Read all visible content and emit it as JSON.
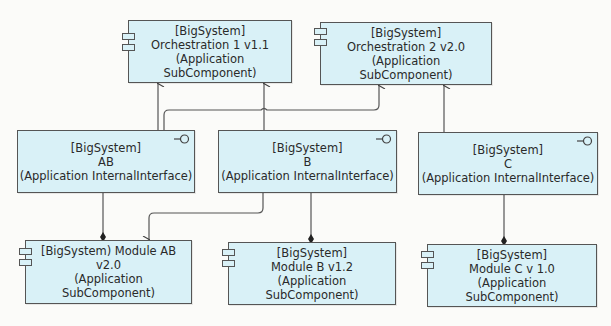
{
  "colors": {
    "node_fill": "#d9f1f7",
    "line": "#555555",
    "background": "#fbfbf9"
  },
  "nodes": {
    "orch1": {
      "label": "[BigSystem]\nOrchestration 1 v1.1\n(Application\nSubComponent)",
      "type": "Application SubComponent"
    },
    "orch2": {
      "label": "[BigSystem]\nOrchestration 2 v2.0\n(Application\nSubComponent)",
      "type": "Application SubComponent"
    },
    "ab": {
      "label": "[BigSystem]\nAB\n(Application InternalInterface)",
      "type": "Application InternalInterface"
    },
    "b": {
      "label": "[BigSystem]\nB\n(Application InternalInterface)",
      "type": "Application InternalInterface"
    },
    "c": {
      "label": "[BigSystem]\nC\n(Application InternalInterface)",
      "type": "Application InternalInterface"
    },
    "modab": {
      "label": "[BigSystem) Module AB\nv2.0\n(Application\nSubComponent)",
      "type": "Application SubComponent"
    },
    "modb": {
      "label": "[BigSystem]\nModule B v1.2\n(Application\nSubComponent)",
      "type": "Application SubComponent"
    },
    "modc": {
      "label": "[BigSystem]\nModule C v 1.0\n(Application\nSubComponent)",
      "type": "Application SubComponent"
    }
  },
  "edges": [
    {
      "from": "ab",
      "to": "orch1",
      "kind": "arrow"
    },
    {
      "from": "ab",
      "to": "orch2",
      "kind": "arrow"
    },
    {
      "from": "b",
      "to": "orch1",
      "kind": "arrow"
    },
    {
      "from": "c",
      "to": "orch2",
      "kind": "arrow"
    },
    {
      "from": "ab",
      "to": "modab",
      "kind": "composition"
    },
    {
      "from": "b",
      "to": "modab",
      "kind": "arrow"
    },
    {
      "from": "b",
      "to": "modb",
      "kind": "composition"
    },
    {
      "from": "c",
      "to": "modc",
      "kind": "composition"
    }
  ]
}
